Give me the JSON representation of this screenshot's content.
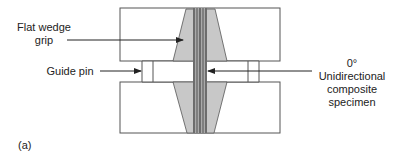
{
  "figure": {
    "panel_label": "(a)",
    "labels": {
      "flat_wedge_grip": [
        "Flat wedge",
        "grip"
      ],
      "guide_pin": "Guide pin",
      "specimen": [
        "0° Unidirectional",
        "composite",
        "specimen"
      ]
    },
    "colors": {
      "outline": "#555555",
      "wedge_fill": "#c8c8c8",
      "specimen_dark": "#666666",
      "specimen_light": "#aaaaaa",
      "arrow": "#222222"
    }
  }
}
